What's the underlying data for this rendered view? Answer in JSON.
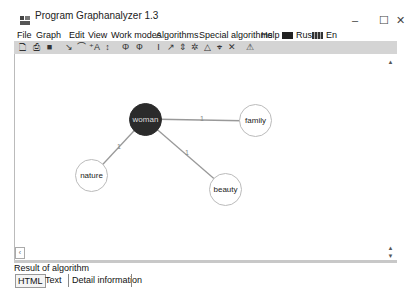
{
  "window": {
    "title": "Program Graphanalyzer 1.3",
    "controls": {
      "minimize": "–",
      "maximize": "☐",
      "close": "✕"
    }
  },
  "menubar": {
    "items": [
      {
        "label": "File"
      },
      {
        "label": "Graph"
      },
      {
        "label": "Edit"
      },
      {
        "label": "View"
      },
      {
        "label": "Work modes"
      },
      {
        "label": "Algorithms"
      },
      {
        "label": "Special algorithms"
      },
      {
        "label": "Help"
      },
      {
        "label": "Rus"
      },
      {
        "label": "En"
      }
    ]
  },
  "toolbar": {
    "buttons": [
      {
        "icon": "new-file-icon",
        "glyph": "🗋"
      },
      {
        "icon": "print-icon",
        "glyph": "⎙"
      },
      {
        "icon": "save-icon",
        "glyph": "■"
      },
      {
        "icon": "edge-tool-icon",
        "glyph": "↘"
      },
      {
        "icon": "arc-tool-icon",
        "glyph": "⌒"
      },
      {
        "icon": "add-vertex-icon",
        "glyph": "⁺A"
      },
      {
        "icon": "move-vertex-icon",
        "glyph": "↕"
      },
      {
        "icon": "algorithm-1-icon",
        "glyph": "Φ"
      },
      {
        "icon": "algorithm-2-icon",
        "glyph": "Ф"
      },
      {
        "icon": "layout-1-icon",
        "glyph": "I"
      },
      {
        "icon": "layout-2-icon",
        "glyph": "↗"
      },
      {
        "icon": "layout-3-icon",
        "glyph": "⇕"
      },
      {
        "icon": "layout-4-icon",
        "glyph": "✲"
      },
      {
        "icon": "layout-5-icon",
        "glyph": "△"
      },
      {
        "icon": "layout-6-icon",
        "glyph": "⌖"
      },
      {
        "icon": "layout-7-icon",
        "glyph": "✕"
      },
      {
        "icon": "warning-icon",
        "glyph": "⚠"
      }
    ]
  },
  "graph": {
    "nodes": [
      {
        "id": "woman",
        "label": "woman",
        "selected": true
      },
      {
        "id": "family",
        "label": "family",
        "selected": false
      },
      {
        "id": "nature",
        "label": "nature",
        "selected": false
      },
      {
        "id": "beauty",
        "label": "beauty",
        "selected": false
      }
    ],
    "edges": [
      {
        "from": "woman",
        "to": "family",
        "weight": "1"
      },
      {
        "from": "woman",
        "to": "nature",
        "weight": "1"
      },
      {
        "from": "woman",
        "to": "beauty",
        "weight": "1"
      }
    ]
  },
  "scrollbar": {
    "left_arrow": "‹",
    "up_arrow": "▲",
    "down_arrow": "▼"
  },
  "result_panel": {
    "label": "Result of algorithm",
    "tabs": [
      {
        "label": "HTML",
        "active": true
      },
      {
        "label": "Text",
        "active": false
      },
      {
        "label": "Detail information",
        "active": false
      }
    ]
  },
  "colors": {
    "selected_node": "#2b2b2b",
    "toolbar_bg": "#d4d4d4",
    "edge": "#999999"
  }
}
